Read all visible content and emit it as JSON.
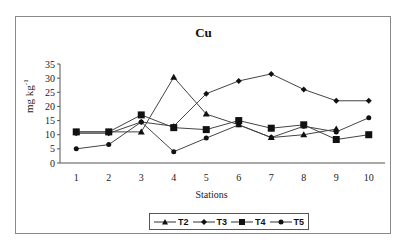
{
  "chart_data": {
    "type": "line",
    "title": "Cu",
    "xlabel": "Stations",
    "ylabel": "mg kg-1",
    "ylabel_display": "mg kg",
    "ylabel_superscript": "-1",
    "categories": [
      "1",
      "2",
      "3",
      "4",
      "5",
      "6",
      "7",
      "8",
      "9",
      "10"
    ],
    "ylim": [
      0,
      35
    ],
    "yticks": [
      "0",
      "5",
      "10",
      "15",
      "20",
      "25",
      "30",
      "35"
    ],
    "grid": false,
    "legend_position": "bottom",
    "series": [
      {
        "name": "T2",
        "marker": "triangle",
        "values": [
          11,
          11,
          11,
          30.3,
          17.3,
          13.5,
          9,
          10,
          12,
          null
        ]
      },
      {
        "name": "T3",
        "marker": "diamond",
        "values": [
          10.5,
          10.5,
          14.5,
          13,
          24.5,
          29,
          31.5,
          26,
          22,
          22
        ]
      },
      {
        "name": "T4",
        "marker": "square",
        "values": [
          11,
          11,
          17,
          12.5,
          11.8,
          15,
          12.3,
          13.5,
          8.3,
          10
        ]
      },
      {
        "name": "T5",
        "marker": "circle",
        "values": [
          5,
          6.5,
          14.5,
          4,
          8.8,
          13.5,
          9,
          13,
          11,
          16
        ]
      }
    ]
  },
  "legend": {
    "items": [
      {
        "label": "T2"
      },
      {
        "label": "T3"
      },
      {
        "label": "T4"
      },
      {
        "label": "T5"
      }
    ]
  }
}
